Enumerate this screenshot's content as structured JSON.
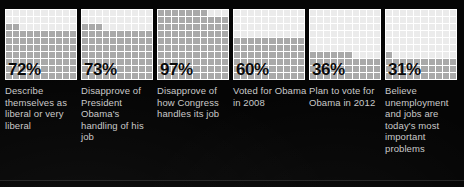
{
  "chart_data": {
    "type": "bar",
    "subtype": "waffle-grid-percentage",
    "title": "",
    "xlabel": "",
    "ylabel": "",
    "ylim": [
      0,
      100
    ],
    "grid": true,
    "legend": false,
    "units": "percent",
    "grid_rows": 10,
    "grid_cols": 10,
    "categories": [
      "Describe themselves as liberal or very liberal",
      "Disapprove of President Obama's handling of his job",
      "Disapprove of how Congress handles its job",
      "Voted for Obama in 2008",
      "Plan to vote for Obama in 2012",
      "Believe unemployment and jobs are today's most important problems"
    ],
    "values": [
      72,
      73,
      97,
      60,
      36,
      31
    ],
    "value_labels": [
      "72%",
      "73%",
      "97%",
      "60%",
      "36%",
      "31%"
    ]
  },
  "colors": {
    "background": "#050505",
    "cell_empty": "#ebebeb",
    "cell_filled": "#a9a9a9",
    "cell_partial": "#c6c6c6",
    "gridline": "#ffffff",
    "value_text": "#0b0b0b",
    "label_text": "#c9c9c9",
    "rule": "#222222"
  },
  "stats": [
    {
      "value": 72,
      "value_label": "72%",
      "label": "Describe themselves as liberal or very liberal"
    },
    {
      "value": 73,
      "value_label": "73%",
      "label": "Disapprove of President Obama's handling of his job"
    },
    {
      "value": 97,
      "value_label": "97%",
      "label": "Disapprove of how Congress handles its job"
    },
    {
      "value": 60,
      "value_label": "60%",
      "label": "Voted for Obama in 2008"
    },
    {
      "value": 36,
      "value_label": "36%",
      "label": "Plan to vote for Obama in 2012"
    },
    {
      "value": 31,
      "value_label": "31%",
      "label": "Believe unemployment and jobs are today's most important problems"
    }
  ]
}
